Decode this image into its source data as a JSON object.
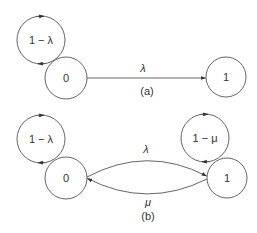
{
  "colors": {
    "line": "#555555",
    "text": "#333333",
    "background": "#ffffff"
  },
  "panel_a": {
    "caption": "(a)",
    "nodes": [
      {
        "id": "0",
        "label": "0"
      },
      {
        "id": "1",
        "label": "1"
      }
    ],
    "self_loop_0": {
      "label": "1 − λ",
      "direction": "clockwise"
    },
    "edges": [
      {
        "from": "0",
        "to": "1",
        "label": "λ"
      }
    ]
  },
  "panel_b": {
    "caption": "(b)",
    "nodes": [
      {
        "id": "0",
        "label": "0"
      },
      {
        "id": "1",
        "label": "1"
      }
    ],
    "self_loop_0": {
      "label": "1 − λ",
      "direction": "clockwise"
    },
    "self_loop_1": {
      "label": "1 − μ",
      "direction": "clockwise"
    },
    "edges": [
      {
        "from": "0",
        "to": "1",
        "label": "λ"
      },
      {
        "from": "1",
        "to": "0",
        "label": "μ"
      }
    ]
  }
}
